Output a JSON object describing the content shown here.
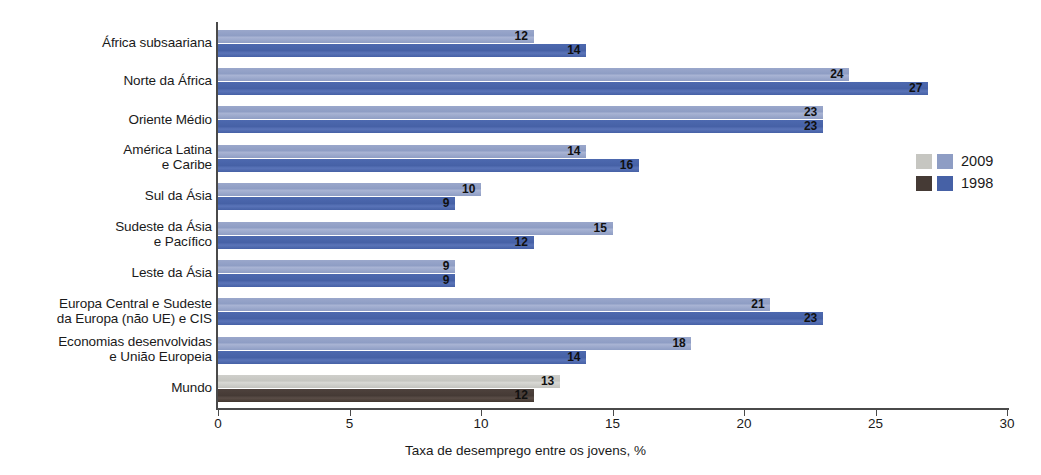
{
  "chart_data": {
    "type": "bar",
    "orientation": "horizontal",
    "title": "",
    "xlabel": "Taxa de desemprego entre os jovens, %",
    "ylabel": "",
    "xlim": [
      0,
      30
    ],
    "xticks": [
      0,
      5,
      10,
      15,
      20,
      25,
      30
    ],
    "xtick_labels": [
      "0",
      "5",
      "10",
      "15",
      "20",
      "25",
      "30"
    ],
    "grid": false,
    "legend_position": "right",
    "categories": [
      "África subsaariana",
      "Norte da África",
      "Oriente Médio",
      "América Latina\ne Caribe",
      "Sul da Ásia",
      "Sudeste da Ásia\ne Pacífico",
      "Leste da Ásia",
      "Europa Central e Sudeste\nda Europa (não UE) e CIS",
      "Economias desenvolvidas\ne União Europeia",
      "Mundo"
    ],
    "series": [
      {
        "name": "2009",
        "color": "#8e9dc4",
        "highlight_color": "#c6c6c1",
        "values": [
          12,
          24,
          23,
          14,
          10,
          15,
          9,
          21,
          18,
          13
        ]
      },
      {
        "name": "1998",
        "color": "#4661a6",
        "highlight_color": "#453a35",
        "values": [
          14,
          27,
          23,
          16,
          9,
          12,
          9,
          23,
          14,
          12
        ]
      }
    ],
    "highlight_category": "Mundo"
  },
  "legend": {
    "items": [
      {
        "label": "2009",
        "swatch_gray": "#c6c6c1",
        "swatch_blue": "#8e9dc4"
      },
      {
        "label": "1998",
        "swatch_gray": "#453a35",
        "swatch_blue": "#4661a6"
      }
    ]
  }
}
